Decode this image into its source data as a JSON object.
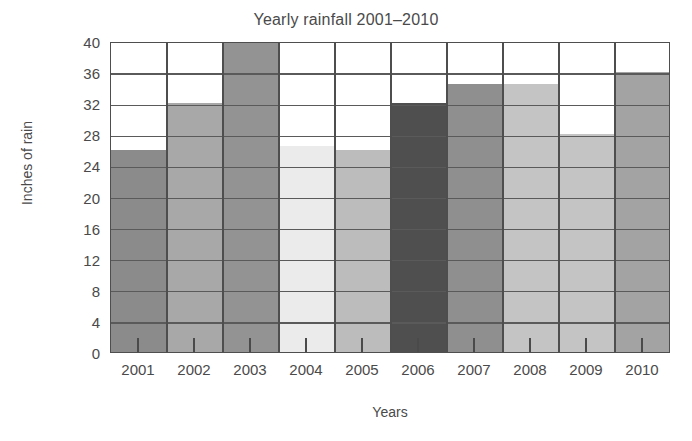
{
  "chart_data": {
    "type": "bar",
    "title": "Yearly rainfall 2001–2010",
    "xlabel": "Years",
    "ylabel": "Inches of rain",
    "categories": [
      "2001",
      "2002",
      "2003",
      "2004",
      "2005",
      "2006",
      "2007",
      "2008",
      "2009",
      "2010"
    ],
    "values": [
      26,
      32,
      40,
      26.5,
      26,
      32,
      34.5,
      34.5,
      28,
      36
    ],
    "bar_colors": [
      "#8b8b8b",
      "#a8a8a8",
      "#939393",
      "#ebebeb",
      "#bcbcbc",
      "#4f4f4f",
      "#8f8f8f",
      "#c4c4c4",
      "#c4c4c4",
      "#a3a3a3"
    ],
    "ylim": [
      0,
      40
    ],
    "yticks": [
      0,
      4,
      8,
      12,
      16,
      20,
      24,
      28,
      32,
      36,
      40
    ],
    "ytick_labels": [
      "0",
      "4",
      "8",
      "12",
      "16",
      "20",
      "24",
      "28",
      "32",
      "36",
      "40"
    ],
    "grid": true,
    "grid_axis": "y",
    "legend": false,
    "series_name": "Rainfall"
  }
}
